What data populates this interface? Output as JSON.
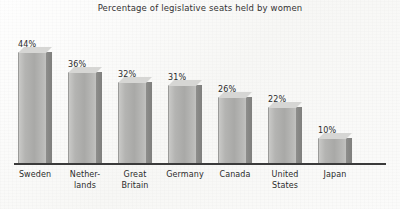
{
  "chart_data": {
    "type": "bar",
    "title": "Percentage of legislative seats held by women",
    "xlabel": "",
    "ylabel": "",
    "ylim": [
      0,
      50
    ],
    "grid": false,
    "legend": "none",
    "categories": [
      "Sweden",
      "Netherlands",
      "Great Britain",
      "Germany",
      "Canada",
      "United States",
      "Japan"
    ],
    "category_lines": [
      [
        "Sweden"
      ],
      [
        "Nether-",
        "lands"
      ],
      [
        "Great",
        "Britain"
      ],
      [
        "Germany"
      ],
      [
        "Canada"
      ],
      [
        "United",
        "States"
      ],
      [
        "Japan"
      ]
    ],
    "values": [
      44,
      36,
      32,
      31,
      26,
      22,
      10
    ],
    "value_labels": [
      "44%",
      "36%",
      "32%",
      "31%",
      "26%",
      "22%",
      "10%"
    ],
    "bar_face_color": "#b4b4b2",
    "bar_side_color": "#85857f",
    "bar_top_color": "#d6d6d4",
    "axis_color": "#3a3a3a",
    "text_color": "#2b2b2b",
    "background_color": "#fdfdfc"
  }
}
